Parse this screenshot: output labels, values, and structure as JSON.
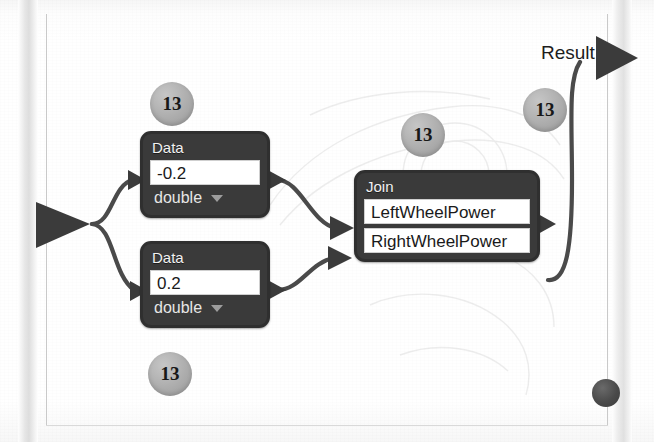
{
  "canvas": {
    "kind": "visual-dataflow-graph",
    "background_color": "#fdfdfd",
    "node_color": "#3a3a3a",
    "field_color": "#ffffff",
    "badge_color": "#ababab",
    "wire_color": "#4a4a4a"
  },
  "graph": {
    "input_port": {
      "name": "graph-input",
      "shape": "triangle-right"
    },
    "nodes": [
      {
        "id": "data-1",
        "title": "Data",
        "value": "-0.2",
        "value_placeholder": "0",
        "type_selected": "double",
        "type_options": [
          "double",
          "int",
          "bool",
          "string"
        ]
      },
      {
        "id": "data-2",
        "title": "Data",
        "value": "0.2",
        "value_placeholder": "0",
        "type_selected": "double",
        "type_options": [
          "double",
          "int",
          "bool",
          "string"
        ]
      },
      {
        "id": "join",
        "title": "Join",
        "fields": [
          {
            "label": "LeftWheelPower"
          },
          {
            "label": "RightWheelPower"
          }
        ]
      }
    ],
    "output": {
      "label": "Result",
      "port_shape": "triangle-right"
    }
  },
  "badges": [
    {
      "id": "badge-1",
      "text": "13"
    },
    {
      "id": "badge-2",
      "text": "13"
    },
    {
      "id": "badge-3",
      "text": "13"
    },
    {
      "id": "badge-4",
      "text": "13"
    }
  ],
  "decorations": {
    "corner_dot": "dot-marker"
  }
}
